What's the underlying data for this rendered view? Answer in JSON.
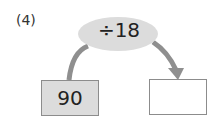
{
  "problem_label": "(4)",
  "operation": "÷18",
  "start_value": "90",
  "answer_value": "",
  "colors": {
    "oval": "#dcdcdc",
    "arrow": "#8f8f8f",
    "start_box": "#dcdcdc",
    "border": "#8c8c8c"
  }
}
